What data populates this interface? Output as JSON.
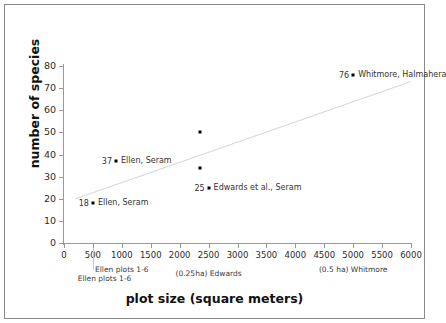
{
  "chart_data": {
    "type": "scatter",
    "title": "",
    "xlabel": "plot size (square meters)",
    "ylabel": "number of species",
    "xlim": [
      0,
      6000
    ],
    "ylim": [
      0,
      80
    ],
    "xticks": [
      0,
      500,
      1000,
      1500,
      2000,
      2500,
      3000,
      3500,
      4000,
      4500,
      5000,
      5500,
      6000
    ],
    "yticks": [
      0,
      10,
      20,
      30,
      40,
      50,
      60,
      70,
      80
    ],
    "grid": false,
    "legend": "none",
    "points": [
      {
        "x": 500,
        "y": 18,
        "value": "18",
        "label": "Ellen, Seram"
      },
      {
        "x": 900,
        "y": 37,
        "value": "37",
        "label": "Ellen, Seram"
      },
      {
        "x": 2350,
        "y": 50,
        "value": "",
        "label": ""
      },
      {
        "x": 2350,
        "y": 34,
        "value": "",
        "label": ""
      },
      {
        "x": 2500,
        "y": 25,
        "value": "25",
        "label": "Edwards et al.,  Seram"
      },
      {
        "x": 5000,
        "y": 76,
        "value": "76",
        "label": "Whitmore, Halmahera"
      }
    ],
    "trendline": {
      "x_start": 200,
      "y_start": 20,
      "x_end": 6000,
      "y_end": 73
    },
    "x_annotations": [
      {
        "x": 1000,
        "text": "Ellen plots 1-6"
      },
      {
        "x": 700,
        "text": "Ellen plots 1-6"
      },
      {
        "x": 2500,
        "text": "(0.25ha) Edwards"
      },
      {
        "x": 5000,
        "text": "(0.5 ha) Whitmore"
      }
    ],
    "tick_labels_text": [
      "0",
      "500",
      "1000",
      "1500",
      "2000",
      "2500",
      "3000",
      "3500",
      "4000",
      "4500",
      "5000",
      "5500",
      "6000"
    ],
    "ytick_labels_text": [
      "0",
      "10",
      "20",
      "30",
      "40",
      "50",
      "60",
      "70",
      "80"
    ]
  }
}
